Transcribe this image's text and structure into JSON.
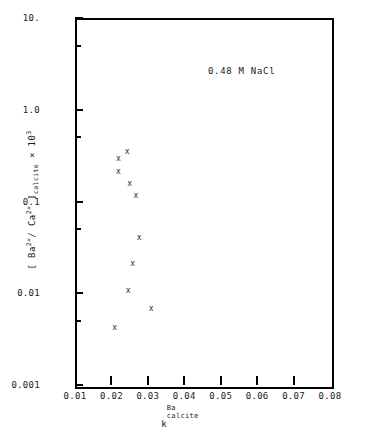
{
  "chart_data": {
    "type": "scatter",
    "title": "",
    "annotation": "0.48 M NaCl",
    "xlabel_base": "k",
    "xlabel_sup": "Ba",
    "xlabel_sub": "calcite",
    "ylabel_parts": {
      "open_bracket": "[",
      "ba": "Ba",
      "ba_charge": "2+",
      "slash": "/",
      "ca": "Ca",
      "ca_charge": "2+",
      "close_bracket": "]",
      "subscript": "calcite",
      "times": "×",
      "base": "10",
      "exponent": "3"
    },
    "ylabel_plain": "[ Ba2+/ Ca2+ ] calcite x 103",
    "xscale": "linear",
    "yscale": "log",
    "xlim": [
      0.01,
      0.08
    ],
    "ylim": [
      0.001,
      10
    ],
    "grid": false,
    "legend": null,
    "marker_symbol": "x",
    "xticks": [
      0.01,
      0.02,
      0.03,
      0.04,
      0.05,
      0.06,
      0.07,
      0.08
    ],
    "xtick_labels": [
      "0.01",
      "0.02",
      "0.03",
      "0.04",
      "0.05",
      "0.06",
      "0.07",
      "0.08"
    ],
    "yticks": [
      10,
      1.0,
      0.1,
      0.01,
      0.001
    ],
    "ytick_labels": [
      "10.",
      "1.0",
      "0.1",
      "0.01",
      "0.001"
    ],
    "yticks_minor": [
      5,
      0.5,
      0.05,
      0.005
    ],
    "points": [
      {
        "x": 0.0243,
        "y": 0.35
      },
      {
        "x": 0.0219,
        "y": 0.29
      },
      {
        "x": 0.0219,
        "y": 0.21
      },
      {
        "x": 0.025,
        "y": 0.155
      },
      {
        "x": 0.0267,
        "y": 0.115
      },
      {
        "x": 0.0276,
        "y": 0.04
      },
      {
        "x": 0.0258,
        "y": 0.021
      },
      {
        "x": 0.0246,
        "y": 0.0105
      },
      {
        "x": 0.0309,
        "y": 0.0068
      },
      {
        "x": 0.0209,
        "y": 0.0042
      }
    ]
  },
  "colors": {
    "axis": "#000000",
    "marker": "#2b2b2b",
    "text": "#1a1a1a",
    "background": "#ffffff"
  }
}
